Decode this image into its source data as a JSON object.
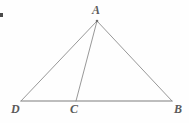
{
  "figure": {
    "kind": "geometry-diagram",
    "background_color": "#fefefe",
    "stroke_color": "#8c8c8c",
    "base_stroke_color": "#a8a8a8",
    "label_color": "#5a5a5a",
    "stroke_width": 0.9,
    "base_stroke_width": 1.4,
    "canvas": {
      "width": 189,
      "height": 123
    },
    "points": {
      "A": {
        "label": "A",
        "x": 97,
        "y": 21
      },
      "D": {
        "label": "D",
        "x": 21,
        "y": 101
      },
      "C": {
        "label": "C",
        "x": 76,
        "y": 101
      },
      "B": {
        "label": "B",
        "x": 172,
        "y": 101
      }
    },
    "segments": [
      {
        "name": "AD",
        "from": "A",
        "to": "D"
      },
      {
        "name": "AC",
        "from": "A",
        "to": "C"
      },
      {
        "name": "AB",
        "from": "A",
        "to": "B"
      },
      {
        "name": "DB",
        "from": "D",
        "to": "B"
      }
    ],
    "marks": {
      "corner_artifact": "•"
    }
  }
}
